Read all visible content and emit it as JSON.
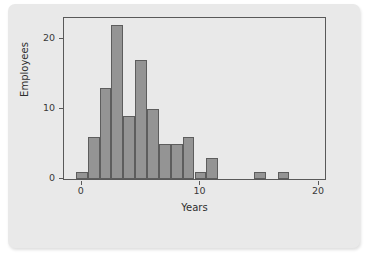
{
  "chart_data": {
    "type": "bar",
    "title": "",
    "xlabel": "Years",
    "ylabel": "Employees",
    "xlim": [
      -1.5,
      20.5
    ],
    "ylim": [
      0,
      23
    ],
    "xticks": [
      0,
      10,
      20
    ],
    "xtick_labels": [
      "0",
      "10",
      "20"
    ],
    "yticks": [
      0,
      10,
      20
    ],
    "ytick_labels": [
      "0",
      "10",
      "20"
    ],
    "grid": false,
    "legend": null,
    "bin_width": 1,
    "bar_color": "#949494",
    "bar_edge_color": "#5d5d5d",
    "plot_background": "#e9e9e9",
    "frame_color": "#595959",
    "bins": [
      {
        "x0": -0.5,
        "x1": 0.5,
        "value": 1
      },
      {
        "x0": 0.5,
        "x1": 1.5,
        "value": 6
      },
      {
        "x0": 1.5,
        "x1": 2.5,
        "value": 13
      },
      {
        "x0": 2.5,
        "x1": 3.5,
        "value": 22
      },
      {
        "x0": 3.5,
        "x1": 4.5,
        "value": 9
      },
      {
        "x0": 4.5,
        "x1": 5.5,
        "value": 17
      },
      {
        "x0": 5.5,
        "x1": 6.5,
        "value": 10
      },
      {
        "x0": 6.5,
        "x1": 7.5,
        "value": 5
      },
      {
        "x0": 7.5,
        "x1": 8.5,
        "value": 5
      },
      {
        "x0": 8.5,
        "x1": 9.5,
        "value": 6
      },
      {
        "x0": 9.5,
        "x1": 10.5,
        "value": 1
      },
      {
        "x0": 10.5,
        "x1": 11.5,
        "value": 3
      },
      {
        "x0": 14.5,
        "x1": 15.5,
        "value": 1
      },
      {
        "x0": 16.5,
        "x1": 17.5,
        "value": 1
      }
    ],
    "categories": [
      0,
      1,
      2,
      3,
      4,
      5,
      6,
      7,
      8,
      9,
      10,
      11,
      15,
      17
    ],
    "values": [
      1,
      6,
      13,
      22,
      9,
      17,
      10,
      5,
      5,
      6,
      1,
      3,
      1,
      1
    ]
  }
}
